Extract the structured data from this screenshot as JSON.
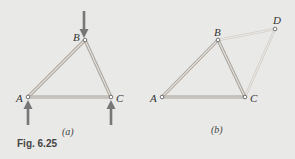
{
  "figure": {
    "caption": "Fig. 6.25",
    "colors": {
      "background": "#e9e9e7",
      "member": "#b9b4ad",
      "member_light": "#d7d3cd",
      "arrow": "#777777"
    },
    "panels": [
      {
        "id": "a",
        "label": "(a)",
        "nodes": {
          "A": "A",
          "B": "B",
          "C": "C"
        },
        "members": [
          "AB",
          "BC",
          "AC"
        ],
        "loads": [
          "downward force at B",
          "upward reaction at A",
          "upward reaction at C"
        ]
      },
      {
        "id": "b",
        "label": "(b)",
        "nodes": {
          "A": "A",
          "B": "B",
          "C": "C",
          "D": "D"
        },
        "members": [
          "AB",
          "BC",
          "AC",
          "BD",
          "CD"
        ]
      }
    ]
  }
}
